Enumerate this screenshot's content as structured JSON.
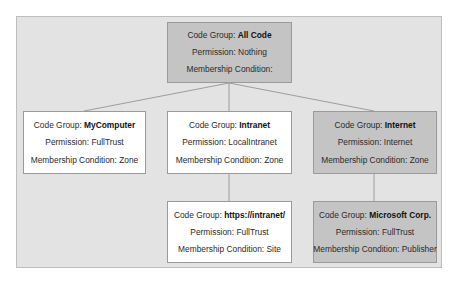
{
  "diagram": {
    "type": "tree",
    "nodes": [
      {
        "id": "all-code",
        "code_group_label": "Code Group: ",
        "code_group": "All Code",
        "permission": "Permission: Nothing",
        "membership": "Membership Condition:",
        "style": "gray",
        "parent": null
      },
      {
        "id": "mycomputer",
        "code_group_label": "Code Group: ",
        "code_group": "MyComputer",
        "permission": "Permission: FullTrust",
        "membership": "Membership Condition: Zone",
        "style": "white",
        "parent": "all-code"
      },
      {
        "id": "intranet",
        "code_group_label": "Code Group: ",
        "code_group": "Intranet",
        "permission": "Permission: LocalIntranet",
        "membership": "Membership Condition: Zone",
        "style": "white",
        "parent": "all-code"
      },
      {
        "id": "internet",
        "code_group_label": "Code Group: ",
        "code_group": "Internet",
        "permission": "Permission: Internet",
        "membership": "Membership Condition: Zone",
        "style": "gray",
        "parent": "all-code"
      },
      {
        "id": "https-intranet",
        "code_group_label": "Code Group: ",
        "code_group": "https://intranet/",
        "permission": "Permission: FullTrust",
        "membership": "Membership Condition: Site",
        "style": "white",
        "parent": "intranet"
      },
      {
        "id": "microsoft-corp",
        "code_group_label": "Code Group: ",
        "code_group": "Microsoft Corp.",
        "permission": "Permission: FullTrust",
        "membership": "Membership Condition: Publisher",
        "style": "gray",
        "parent": "internet"
      }
    ]
  },
  "colors": {
    "frame_background": "#e3e3e3",
    "highlighted_node": "#c4c4c4",
    "plain_node": "#ffffff",
    "connector": "#8a8a8a"
  }
}
